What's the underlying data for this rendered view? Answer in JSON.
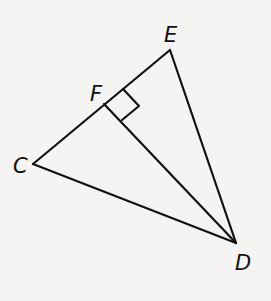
{
  "diagram": {
    "type": "geometry",
    "stroke_color": "#111111",
    "background_color": "#f5f4f3",
    "points": {
      "C": {
        "label": "C",
        "x": 33,
        "y": 164
      },
      "E": {
        "label": "E",
        "x": 170,
        "y": 50
      },
      "F": {
        "label": "F",
        "x": 104,
        "y": 104
      },
      "D": {
        "label": "D",
        "x": 236,
        "y": 243
      }
    },
    "segments": [
      {
        "from": "C",
        "to": "E"
      },
      {
        "from": "E",
        "to": "D"
      },
      {
        "from": "C",
        "to": "D"
      },
      {
        "from": "F",
        "to": "D"
      }
    ],
    "right_angle": {
      "vertex": "F",
      "between": [
        "E",
        "D"
      ]
    }
  }
}
